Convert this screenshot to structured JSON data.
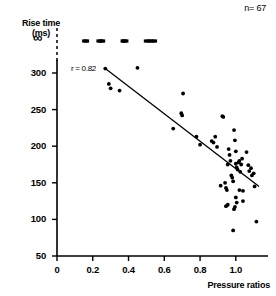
{
  "chart_data": {
    "type": "scatter",
    "title": "",
    "xlabel": "Pressure ratios",
    "ylabel": "Rise time",
    "ylabel_units": "(ms)",
    "xlim": [
      0,
      1.18
    ],
    "ylim": [
      50,
      315
    ],
    "xticks": [
      0,
      0.2,
      0.4,
      0.6,
      0.8,
      1.0
    ],
    "xticklabels": [
      "0",
      "0.2",
      "0.4",
      "0.6",
      "0.8",
      "1.0"
    ],
    "yticks": [
      50,
      100,
      150,
      200,
      250,
      300
    ],
    "yticklabels": [
      "50",
      "100",
      "150",
      "200",
      "250",
      "300"
    ],
    "y_extra_tick_label": "∞",
    "grid": false,
    "legend": null,
    "annotations": [
      {
        "name": "sample-size",
        "text": "n= 67",
        "x_px": 232,
        "y_px": 8
      },
      {
        "name": "correlation",
        "text": "r = 0.82",
        "x_px": 71,
        "y_px": 65
      }
    ],
    "series": [
      {
        "name": "observations",
        "marker": "filled-circle",
        "color": "#000000",
        "points": [
          [
            0.27,
            306
          ],
          [
            0.29,
            285
          ],
          [
            0.3,
            279
          ],
          [
            0.35,
            276
          ],
          [
            0.45,
            307
          ],
          [
            0.65,
            224
          ],
          [
            0.695,
            245
          ],
          [
            0.7,
            242
          ],
          [
            0.705,
            272
          ],
          [
            0.78,
            213
          ],
          [
            0.8,
            202
          ],
          [
            0.865,
            207
          ],
          [
            0.875,
            205
          ],
          [
            0.885,
            213
          ],
          [
            0.895,
            199
          ],
          [
            0.925,
            241
          ],
          [
            0.93,
            240
          ],
          [
            0.94,
            150
          ],
          [
            0.945,
            143
          ],
          [
            0.95,
            140
          ],
          [
            0.955,
            175
          ],
          [
            0.96,
            196
          ],
          [
            0.965,
            188
          ],
          [
            0.97,
            180
          ],
          [
            0.975,
            160
          ],
          [
            0.98,
            157
          ],
          [
            0.985,
            152
          ],
          [
            0.99,
            222
          ],
          [
            0.995,
            208
          ],
          [
            1.0,
            193
          ],
          [
            1.0,
            176
          ],
          [
            1.005,
            171
          ],
          [
            1.01,
            168
          ],
          [
            1.015,
            178
          ],
          [
            1.02,
            180
          ],
          [
            1.025,
            165
          ],
          [
            1.03,
            175
          ],
          [
            1.035,
            183
          ],
          [
            1.0,
            130
          ],
          [
            1.005,
            123
          ],
          [
            0.995,
            117
          ],
          [
            0.99,
            114
          ],
          [
            0.985,
            85
          ],
          [
            1.02,
            140
          ],
          [
            1.04,
            139
          ],
          [
            1.06,
            192
          ],
          [
            1.07,
            174
          ],
          [
            1.075,
            166
          ],
          [
            1.085,
            170
          ],
          [
            1.09,
            160
          ],
          [
            1.1,
            163
          ],
          [
            1.105,
            145
          ],
          [
            1.115,
            97
          ],
          [
            0.945,
            118
          ],
          [
            0.955,
            120
          ],
          [
            1.04,
            125
          ],
          [
            0.915,
            146
          ]
        ]
      },
      {
        "name": "censored-infinite-rise-time",
        "marker": "filled-bar",
        "color": "#000000",
        "y_position": "infinity",
        "x_values": [
          0.155,
          0.165,
          0.235,
          0.245,
          0.255,
          0.37,
          0.375,
          0.385,
          0.5,
          0.515,
          0.53,
          0.545
        ]
      }
    ],
    "regression_line": {
      "name": "fit-line",
      "x_start": 0.27,
      "y_start": 306,
      "x_end": 1.13,
      "y_end": 145,
      "color": "#000000"
    },
    "axis_break": {
      "name": "axis-break-dashed",
      "style": "dashed-vertical",
      "x": 0.0,
      "y_from": 300,
      "y_to": 315
    }
  }
}
